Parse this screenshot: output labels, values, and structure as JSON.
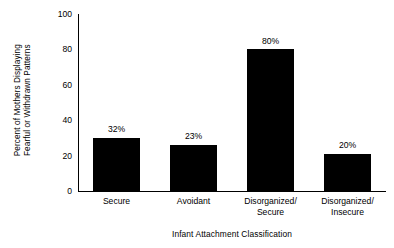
{
  "chart_data": {
    "type": "bar",
    "title": "",
    "xlabel": "Infant Attachment Classification",
    "ylabel_line1": "Percent of Mothers Displaying",
    "ylabel_line2": "Fearful or Withdrawn Patterns",
    "categories": [
      "Secure",
      "Avoidant",
      "Disorganized/\nSecure",
      "Disorganized/\nInsecure"
    ],
    "category_lines": [
      [
        "Secure",
        ""
      ],
      [
        "Avoidant",
        ""
      ],
      [
        "Disorganized/",
        "Secure"
      ],
      [
        "Disorganized/",
        "Insecure"
      ]
    ],
    "values": [
      32,
      23,
      80,
      20
    ],
    "value_labels": [
      "32%",
      "23%",
      "80%",
      "20%"
    ],
    "drawn_heights": [
      30,
      26,
      80,
      21
    ],
    "ylim": [
      0,
      100
    ],
    "yticks": [
      0,
      20,
      40,
      60,
      80,
      100
    ],
    "ytick_labels": [
      "0",
      "20",
      "40",
      "60",
      "80",
      "100"
    ],
    "grid": false,
    "legend": false,
    "bar_color": "#000000",
    "background_color": "#ffffff",
    "axis_color": "#000000"
  }
}
